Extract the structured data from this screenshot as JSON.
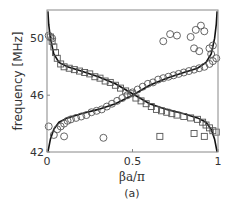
{
  "chart_data": {
    "type": "scatter",
    "title": "",
    "panel_label": "(a)",
    "xlabel": "βa/π",
    "ylabel": "frequency [MHz]",
    "xlim": [
      0,
      1
    ],
    "ylim": [
      42,
      52
    ],
    "xticks": [
      {
        "value": 0,
        "label": "0"
      },
      {
        "value": 0.5,
        "label": "0.5"
      },
      {
        "value": 1,
        "label": "1"
      }
    ],
    "yticks": [
      {
        "value": 42,
        "label": "42"
      },
      {
        "value": 46,
        "label": "46"
      },
      {
        "value": 50,
        "label": "50"
      }
    ],
    "grid": false,
    "legend": "none",
    "series": [
      {
        "name": "theory-upper-branch",
        "style": "line",
        "color": "#111111",
        "points": [
          [
            0.005,
            51.9
          ],
          [
            0.01,
            51.0
          ],
          [
            0.02,
            50.0
          ],
          [
            0.04,
            48.9
          ],
          [
            0.07,
            48.3
          ],
          [
            0.12,
            48.0
          ],
          [
            0.2,
            47.7
          ],
          [
            0.3,
            47.3
          ],
          [
            0.4,
            46.8
          ],
          [
            0.5,
            46.1
          ],
          [
            0.6,
            45.4
          ],
          [
            0.7,
            45.0
          ],
          [
            0.8,
            44.7
          ],
          [
            0.88,
            44.4
          ],
          [
            0.93,
            44.1
          ],
          [
            0.96,
            43.6
          ],
          [
            0.98,
            42.9
          ],
          [
            0.995,
            42.0
          ]
        ]
      },
      {
        "name": "theory-lower-branch",
        "style": "line",
        "color": "#111111",
        "points": [
          [
            0.005,
            42.0
          ],
          [
            0.02,
            42.9
          ],
          [
            0.04,
            43.6
          ],
          [
            0.07,
            44.1
          ],
          [
            0.12,
            44.4
          ],
          [
            0.2,
            44.7
          ],
          [
            0.3,
            45.0
          ],
          [
            0.4,
            45.4
          ],
          [
            0.5,
            46.0
          ],
          [
            0.6,
            46.7
          ],
          [
            0.7,
            47.2
          ],
          [
            0.8,
            47.6
          ],
          [
            0.88,
            47.9
          ],
          [
            0.93,
            48.3
          ],
          [
            0.96,
            48.9
          ],
          [
            0.98,
            50.0
          ],
          [
            0.99,
            51.0
          ],
          [
            0.995,
            51.9
          ]
        ]
      },
      {
        "name": "measured-squares",
        "style": "marker",
        "marker": "square",
        "color": "#555555",
        "points": [
          [
            0.02,
            50.1
          ],
          [
            0.03,
            49.8
          ],
          [
            0.04,
            49.4
          ],
          [
            0.05,
            49.0
          ],
          [
            0.06,
            48.6
          ],
          [
            0.08,
            48.2
          ],
          [
            0.1,
            48.0
          ],
          [
            0.13,
            47.9
          ],
          [
            0.16,
            47.8
          ],
          [
            0.19,
            47.7
          ],
          [
            0.22,
            47.6
          ],
          [
            0.25,
            47.5
          ],
          [
            0.28,
            47.3
          ],
          [
            0.31,
            47.2
          ],
          [
            0.34,
            47.0
          ],
          [
            0.37,
            46.9
          ],
          [
            0.4,
            46.7
          ],
          [
            0.43,
            46.5
          ],
          [
            0.46,
            46.3
          ],
          [
            0.49,
            46.1
          ],
          [
            0.52,
            45.8
          ],
          [
            0.55,
            45.6
          ],
          [
            0.58,
            45.4
          ],
          [
            0.61,
            45.2
          ],
          [
            0.64,
            45.0
          ],
          [
            0.67,
            44.9
          ],
          [
            0.7,
            44.8
          ],
          [
            0.73,
            44.7
          ],
          [
            0.76,
            44.6
          ],
          [
            0.8,
            44.5
          ],
          [
            0.84,
            44.4
          ],
          [
            0.88,
            44.3
          ],
          [
            0.91,
            44.1
          ],
          [
            0.93,
            43.9
          ],
          [
            0.95,
            43.7
          ],
          [
            0.97,
            43.5
          ],
          [
            0.99,
            43.4
          ],
          [
            0.86,
            43.3
          ],
          [
            0.92,
            43.1
          ],
          [
            0.66,
            43.1
          ]
        ]
      },
      {
        "name": "measured-circles",
        "style": "marker",
        "marker": "circle",
        "color": "#555555",
        "points": [
          [
            0.01,
            50.2
          ],
          [
            0.03,
            50.0
          ],
          [
            0.01,
            43.8
          ],
          [
            0.06,
            43.6
          ],
          [
            0.08,
            43.8
          ],
          [
            0.1,
            44.0
          ],
          [
            0.12,
            44.2
          ],
          [
            0.14,
            44.3
          ],
          [
            0.17,
            44.4
          ],
          [
            0.2,
            44.5
          ],
          [
            0.23,
            44.6
          ],
          [
            0.26,
            44.8
          ],
          [
            0.29,
            44.9
          ],
          [
            0.32,
            45.0
          ],
          [
            0.35,
            45.2
          ],
          [
            0.38,
            45.4
          ],
          [
            0.41,
            45.6
          ],
          [
            0.44,
            45.8
          ],
          [
            0.47,
            46.0
          ],
          [
            0.5,
            46.2
          ],
          [
            0.53,
            46.4
          ],
          [
            0.56,
            46.6
          ],
          [
            0.59,
            46.8
          ],
          [
            0.62,
            46.9
          ],
          [
            0.65,
            47.1
          ],
          [
            0.68,
            47.2
          ],
          [
            0.71,
            47.3
          ],
          [
            0.74,
            47.4
          ],
          [
            0.77,
            47.5
          ],
          [
            0.8,
            47.6
          ],
          [
            0.83,
            47.7
          ],
          [
            0.86,
            47.8
          ],
          [
            0.89,
            47.9
          ],
          [
            0.92,
            48.0
          ],
          [
            0.95,
            48.2
          ],
          [
            0.97,
            48.4
          ],
          [
            0.99,
            48.6
          ],
          [
            0.96,
            48.9
          ],
          [
            0.95,
            49.3
          ],
          [
            0.97,
            49.5
          ],
          [
            0.89,
            49.1
          ],
          [
            0.86,
            49.3
          ],
          [
            0.84,
            50.1
          ],
          [
            0.87,
            50.6
          ],
          [
            0.9,
            50.9
          ],
          [
            0.92,
            50.5
          ],
          [
            0.68,
            49.8
          ],
          [
            0.72,
            50.3
          ],
          [
            0.76,
            50.2
          ],
          [
            0.04,
            43.2
          ],
          [
            0.1,
            43.1
          ],
          [
            0.33,
            43.0
          ]
        ]
      }
    ]
  }
}
